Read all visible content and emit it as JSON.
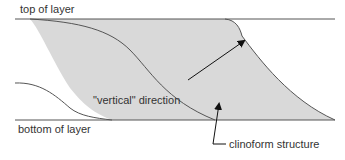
{
  "labels": {
    "top_of_layer": "top of layer",
    "bottom_of_layer": "bottom of layer",
    "vertical_direction": "\"vertical\" direction",
    "clinoform_structure": "clinoform structure"
  },
  "colors": {
    "fill": "#d9d9d9",
    "line": "#555555",
    "arrow": "#111111",
    "text": "#333333"
  }
}
